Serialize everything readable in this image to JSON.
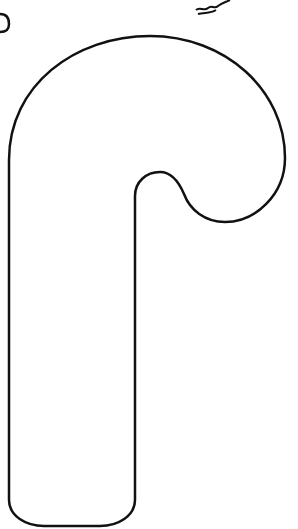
{
  "image": {
    "subject": "candy-cane-outline",
    "stroke_color": "#111111",
    "background_color": "#ffffff"
  }
}
